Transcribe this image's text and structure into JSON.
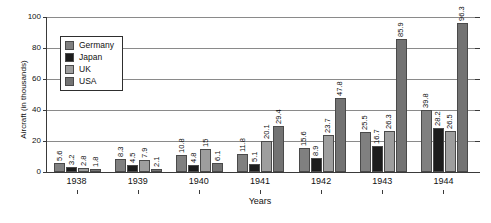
{
  "chart_data": {
    "type": "bar",
    "title": "",
    "subtitle": "",
    "xlabel": "Years",
    "ylabel": "Aircraft (in thousands)",
    "categories": [
      "1938",
      "1939",
      "1940",
      "1941",
      "1942",
      "1943",
      "1944"
    ],
    "ylim": [
      0,
      100
    ],
    "yticks": [
      0,
      20,
      40,
      60,
      80,
      100
    ],
    "grid": true,
    "legend_position": "upper-left-inside",
    "series": [
      {
        "name": "Germany",
        "color": "#808080",
        "values": [
          5.6,
          8.3,
          10.8,
          11.8,
          15.6,
          25.5,
          39.8
        ],
        "labels": [
          "5.6",
          "8.3",
          "10.8",
          "11.8",
          "15.6",
          "25.5",
          "39.8"
        ]
      },
      {
        "name": "Japan",
        "color": "#1c1c1c",
        "values": [
          3.2,
          4.5,
          4.8,
          5.1,
          8.9,
          16.7,
          28.2
        ],
        "labels": [
          "3.2",
          "4.5",
          "4.8",
          "5.1",
          "8.9",
          "16.7",
          "28.2"
        ]
      },
      {
        "name": "UK",
        "color": "#9e9e9e",
        "values": [
          2.8,
          7.9,
          15,
          20.1,
          23.7,
          26.3,
          26.5
        ],
        "labels": [
          "2.8",
          "7.9",
          "15",
          "20.1",
          "23.7",
          "26.3",
          "26.5"
        ]
      },
      {
        "name": "USA",
        "color": "#737373",
        "values": [
          1.8,
          2.1,
          6.1,
          29.4,
          47.8,
          85.9,
          96.3
        ],
        "labels": [
          "1.8",
          "2.1",
          "6.1",
          "29.4",
          "47.8",
          "85.9",
          "96.3"
        ]
      }
    ]
  },
  "axis": {
    "y_tick_labels": [
      "0",
      "20",
      "40",
      "60",
      "80",
      "100"
    ],
    "y_title": "Aircraft (in thousands)",
    "x_title": "Years",
    "x_tick_labels": [
      "1938",
      "1939",
      "1940",
      "1941",
      "1942",
      "1943",
      "1944"
    ]
  },
  "legend": {
    "items": [
      {
        "label": "Germany",
        "color": "#808080"
      },
      {
        "label": "Japan",
        "color": "#1c1c1c"
      },
      {
        "label": "UK",
        "color": "#9e9e9e"
      },
      {
        "label": "USA",
        "color": "#737373"
      }
    ]
  }
}
